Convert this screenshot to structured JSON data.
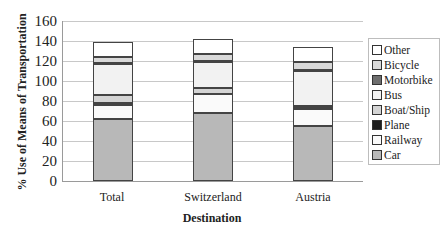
{
  "chart_data": {
    "type": "bar",
    "stacked": true,
    "title": "",
    "xlabel": "Destination",
    "ylabel": "% Use of Means of Transportation",
    "ylim": [
      0,
      160
    ],
    "yticks": [
      0,
      20,
      40,
      60,
      80,
      100,
      120,
      140,
      160
    ],
    "grid": true,
    "legend_position": "right",
    "categories": [
      "Total",
      "Switzerland",
      "Austria"
    ],
    "series": [
      {
        "name": "Car",
        "color": "#b8b8b8",
        "values": [
          62,
          68,
          55
        ]
      },
      {
        "name": "Railway",
        "color": "#fafafa",
        "values": [
          14,
          19,
          17
        ]
      },
      {
        "name": "Plane",
        "color": "#1e1e1e",
        "values": [
          2,
          0,
          1
        ]
      },
      {
        "name": "Boat/Ship",
        "color": "#d4d4d4",
        "values": [
          8,
          6,
          2
        ]
      },
      {
        "name": "Bus",
        "color": "#f2f2f2",
        "values": [
          31,
          26,
          35
        ]
      },
      {
        "name": "Motorbike",
        "color": "#6e6e6e",
        "values": [
          1,
          1,
          1
        ]
      },
      {
        "name": "Bicycle",
        "color": "#d9d9d9",
        "values": [
          6,
          7,
          8
        ]
      },
      {
        "name": "Other",
        "color": "#ffffff",
        "values": [
          15,
          15,
          15
        ]
      }
    ],
    "legend_order": [
      "Other",
      "Bicycle",
      "Motorbike",
      "Bus",
      "Boat/Ship",
      "Plane",
      "Railway",
      "Car"
    ]
  },
  "axis": {
    "ylabel": "% Use of Means of Transportation",
    "xlabel": "Destination",
    "yticks": [
      "160",
      "140",
      "120",
      "100",
      "80",
      "60",
      "40",
      "20",
      "0"
    ],
    "xticks": [
      "Total",
      "Switzerland",
      "Austria"
    ]
  },
  "legend": {
    "items": [
      {
        "label": "Other",
        "color": "#ffffff"
      },
      {
        "label": "Bicycle",
        "color": "#d9d9d9"
      },
      {
        "label": "Motorbike",
        "color": "#6e6e6e"
      },
      {
        "label": "Bus",
        "color": "#f2f2f2"
      },
      {
        "label": "Boat/Ship",
        "color": "#d4d4d4"
      },
      {
        "label": "Plane",
        "color": "#1e1e1e"
      },
      {
        "label": "Railway",
        "color": "#fafafa"
      },
      {
        "label": "Car",
        "color": "#b8b8b8"
      }
    ]
  }
}
